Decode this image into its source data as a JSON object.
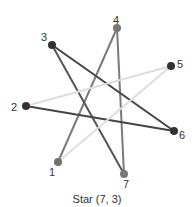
{
  "diagram": {
    "caption": "Star (7, 3)",
    "nodes": [
      {
        "id": "1",
        "label": "1",
        "x": 58,
        "y": 162,
        "lx": 49,
        "ly": 176,
        "color": "#707070"
      },
      {
        "id": "2",
        "label": "2",
        "x": 26,
        "y": 106,
        "lx": 11,
        "ly": 111,
        "color": "#333333"
      },
      {
        "id": "3",
        "label": "3",
        "x": 52,
        "y": 45,
        "lx": 41,
        "ly": 41,
        "color": "#333333"
      },
      {
        "id": "4",
        "label": "4",
        "x": 117,
        "y": 28,
        "lx": 113,
        "ly": 24,
        "color": "#777777"
      },
      {
        "id": "5",
        "label": "5",
        "x": 171,
        "y": 66,
        "lx": 177,
        "ly": 68,
        "color": "#333333"
      },
      {
        "id": "6",
        "label": "6",
        "x": 174,
        "y": 131,
        "lx": 179,
        "ly": 139,
        "color": "#333333"
      },
      {
        "id": "7",
        "label": "7",
        "x": 124,
        "y": 174,
        "lx": 123,
        "ly": 188,
        "color": "#777777"
      }
    ],
    "edges": [
      {
        "from": "1",
        "to": "4",
        "color": "#7a7a7a"
      },
      {
        "from": "4",
        "to": "7",
        "color": "#7a7a7a"
      },
      {
        "from": "7",
        "to": "3",
        "color": "#555555"
      },
      {
        "from": "3",
        "to": "6",
        "color": "#444444"
      },
      {
        "from": "6",
        "to": "2",
        "color": "#444444"
      },
      {
        "from": "2",
        "to": "5",
        "color": "#dddddd"
      },
      {
        "from": "5",
        "to": "1",
        "color": "#dddddd"
      }
    ]
  }
}
